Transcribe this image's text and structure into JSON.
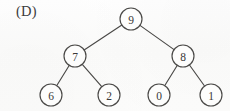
{
  "figure": {
    "panel_label": "(D)",
    "type": "binary-tree-diagram",
    "background_color": "#fdfdfc",
    "ink_color": "#4a4947"
  },
  "chart_data": {
    "type": "diagram",
    "title": "(D)",
    "structure": "binary-tree",
    "nodes": [
      {
        "id": "root",
        "label": "9",
        "cx": 131,
        "cy": 19,
        "r": 11,
        "level": 0
      },
      {
        "id": "n7",
        "label": "7",
        "cx": 75,
        "cy": 56,
        "r": 11,
        "level": 1
      },
      {
        "id": "n8",
        "label": "8",
        "cx": 183,
        "cy": 56,
        "r": 11,
        "level": 1
      },
      {
        "id": "n6",
        "label": "6",
        "cx": 51,
        "cy": 95,
        "r": 11,
        "level": 2
      },
      {
        "id": "n2",
        "label": "2",
        "cx": 109,
        "cy": 95,
        "r": 11,
        "level": 2
      },
      {
        "id": "n0",
        "label": "0",
        "cx": 159,
        "cy": 95,
        "r": 11,
        "level": 2
      },
      {
        "id": "n1",
        "label": "1",
        "cx": 211,
        "cy": 95,
        "r": 11,
        "level": 2
      }
    ],
    "edges": [
      {
        "from": "root",
        "to": "n7"
      },
      {
        "from": "root",
        "to": "n8"
      },
      {
        "from": "n7",
        "to": "n6"
      },
      {
        "from": "n7",
        "to": "n2"
      },
      {
        "from": "n8",
        "to": "n0"
      },
      {
        "from": "n8",
        "to": "n1"
      }
    ],
    "level_order": [
      "9",
      "7",
      "8",
      "6",
      "2",
      "0",
      "1"
    ],
    "xlabel": "",
    "ylabel": ""
  }
}
